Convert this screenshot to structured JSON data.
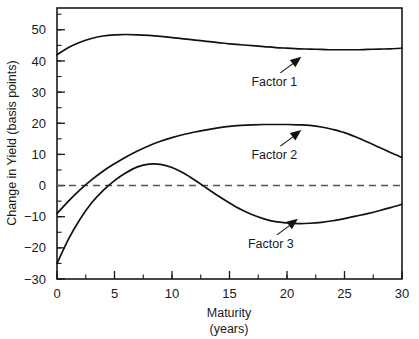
{
  "chart_data": {
    "type": "line",
    "title": "",
    "xlabel": "Maturity",
    "xlabel_sub": "(years)",
    "ylabel": "Change in Yield (basis points)",
    "xlim": [
      0,
      30
    ],
    "ylim": [
      -30,
      57
    ],
    "grid": false,
    "legend_position": "inline-annotations",
    "x_ticks": [
      0,
      5,
      10,
      15,
      20,
      25,
      30
    ],
    "x_tick_labels": [
      "0",
      "5",
      "10",
      "15",
      "20",
      "25",
      "30"
    ],
    "x_minor_step": 2.5,
    "y_ticks": [
      -30,
      -20,
      -10,
      0,
      10,
      20,
      30,
      40,
      50
    ],
    "y_tick_labels": [
      "−30",
      "−20",
      "−10",
      "0",
      "10",
      "20",
      "30",
      "40",
      "50"
    ],
    "y_minor_step": 5,
    "reference_line": {
      "value": 0,
      "style": "dashed"
    },
    "x": [
      0,
      1,
      2,
      3,
      4,
      5,
      6,
      7,
      8,
      9,
      10,
      11,
      12,
      13,
      14,
      15,
      16,
      17,
      18,
      19,
      20,
      21,
      22,
      23,
      24,
      25,
      26,
      27,
      28,
      29,
      30
    ],
    "series": [
      {
        "name": "Factor 1",
        "values": [
          42.0,
          44.3,
          46.0,
          47.2,
          48.0,
          48.4,
          48.5,
          48.4,
          48.2,
          47.9,
          47.5,
          47.1,
          46.7,
          46.3,
          45.9,
          45.5,
          45.2,
          44.9,
          44.6,
          44.3,
          44.1,
          43.9,
          43.8,
          43.7,
          43.6,
          43.6,
          43.6,
          43.7,
          43.8,
          43.9,
          44.1
        ]
      },
      {
        "name": "Factor 2",
        "values": [
          -9.0,
          -5.0,
          -1.4,
          1.8,
          4.6,
          7.0,
          9.2,
          11.1,
          12.8,
          14.2,
          15.4,
          16.4,
          17.2,
          17.9,
          18.5,
          19.0,
          19.3,
          19.5,
          19.6,
          19.6,
          19.6,
          19.5,
          19.3,
          18.8,
          18.0,
          17.0,
          15.6,
          14.0,
          12.3,
          10.6,
          9.0
        ]
      },
      {
        "name": "Factor 3",
        "values": [
          -25.0,
          -17.2,
          -10.8,
          -5.6,
          -1.6,
          1.6,
          4.1,
          6.0,
          6.9,
          6.8,
          5.8,
          4.0,
          1.7,
          -0.8,
          -3.3,
          -5.6,
          -7.7,
          -9.4,
          -10.7,
          -11.6,
          -12.0,
          -12.2,
          -12.1,
          -11.8,
          -11.3,
          -10.6,
          -9.8,
          -9.0,
          -8.1,
          -7.1,
          -6.0
        ]
      }
    ],
    "annotations": [
      {
        "text": "Factor 1",
        "label_x": 18.9,
        "label_y": 32.0
      },
      {
        "text": "Factor 2",
        "label_x": 18.9,
        "label_y": 8.5
      },
      {
        "text": "Factor 3",
        "label_x": 18.6,
        "label_y": -20.0
      }
    ]
  }
}
